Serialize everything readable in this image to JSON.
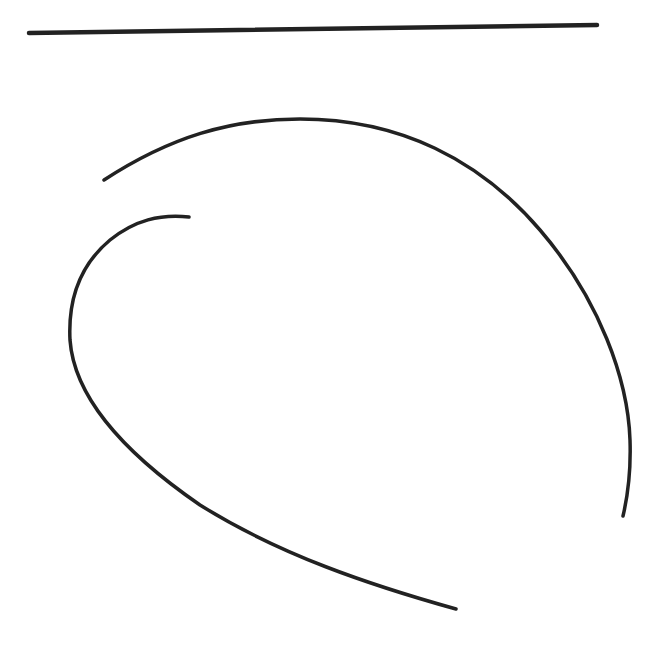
{
  "drawing": {
    "stroke_color": "#222222",
    "background": "#ffffff",
    "strokes": [
      {
        "name": "horizontal-line",
        "d": "M 29 33 L 597 25",
        "width": 4.5
      },
      {
        "name": "outer-arc",
        "d": "M 104 180 C 170 137, 230 119, 300 119 C 400 119, 480 160, 540 230 C 600 300, 628 380, 630 440 C 631 470, 628 495, 623 516",
        "width": 3.5
      },
      {
        "name": "inner-curve",
        "d": "M 189 217 C 160 214, 135 220, 110 240 C 80 265, 68 300, 70 340 C 74 395, 120 450, 200 505 C 280 555, 370 585, 456 609",
        "width": 3.5
      }
    ]
  }
}
